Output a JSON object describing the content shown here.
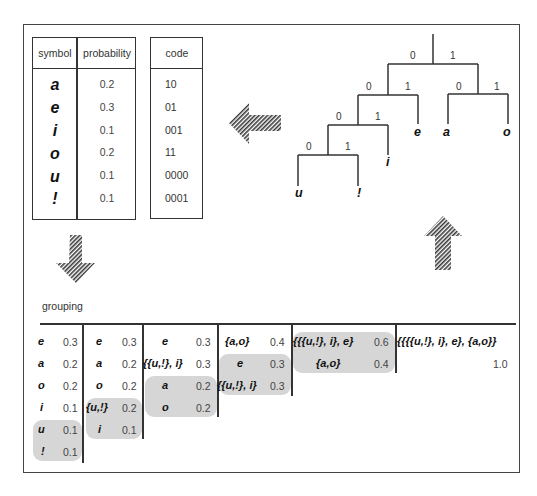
{
  "symbol_table": {
    "headers": [
      "symbol",
      "probability"
    ],
    "rows": [
      {
        "symbol": "a",
        "probability": "0.2"
      },
      {
        "symbol": "e",
        "probability": "0.3"
      },
      {
        "symbol": "i",
        "probability": "0.1"
      },
      {
        "symbol": "o",
        "probability": "0.2"
      },
      {
        "symbol": "u",
        "probability": "0.1"
      },
      {
        "symbol": "!",
        "probability": "0.1"
      }
    ]
  },
  "code_table": {
    "header": "code",
    "codes": [
      "10",
      "01",
      "001",
      "11",
      "0000",
      "0001"
    ]
  },
  "tree": {
    "edge_labels": {
      "root_left": "0",
      "root_right": "1",
      "l1_left": "0",
      "l1_right": "1",
      "r1_left": "0",
      "r1_right": "1",
      "l2_left": "0",
      "l2_right": "1",
      "l3_left": "0",
      "l3_right": "1"
    },
    "leaves": {
      "u": "u",
      "excl": "!",
      "i": "i",
      "e": "e",
      "a": "a",
      "o": "o"
    }
  },
  "arrows": {
    "left": "left-arrow",
    "down": "down-arrow",
    "up": "up-arrow"
  },
  "grouping": {
    "title": "grouping",
    "columns": [
      [
        {
          "s": "e",
          "p": "0.3"
        },
        {
          "s": "a",
          "p": "0.2"
        },
        {
          "s": "o",
          "p": "0.2"
        },
        {
          "s": "i",
          "p": "0.1"
        },
        {
          "s": "u",
          "p": "0.1"
        },
        {
          "s": "!",
          "p": "0.1"
        }
      ],
      [
        {
          "s": "e",
          "p": "0.3"
        },
        {
          "s": "a",
          "p": "0.2"
        },
        {
          "s": "o",
          "p": "0.2"
        },
        {
          "s": "{u,!}",
          "p": "0.2"
        },
        {
          "s": "i",
          "p": "0.1"
        }
      ],
      [
        {
          "s": "e",
          "p": "0.3"
        },
        {
          "s": "{{u,!}, i}",
          "p": "0.3"
        },
        {
          "s": "a",
          "p": "0.2"
        },
        {
          "s": "o",
          "p": "0.2"
        }
      ],
      [
        {
          "s": "{a,o}",
          "p": "0.4"
        },
        {
          "s": "e",
          "p": "0.3"
        },
        {
          "s": "{{u,!}, i}",
          "p": "0.3"
        }
      ],
      [
        {
          "s": "{{{u,!}, i}, e}",
          "p": "0.6"
        },
        {
          "s": "{a,o}",
          "p": "0.4"
        }
      ],
      [
        {
          "s": "{{{{u,!}, i}, e}, {a,o}}",
          "p": "1.0"
        }
      ]
    ]
  }
}
